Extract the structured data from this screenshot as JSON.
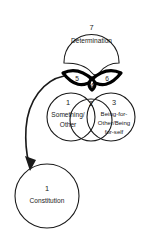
{
  "diagram": {
    "type": "logic-moment-diagram",
    "background_color": "#ffffff",
    "stroke_color": "#1a1a1a",
    "accent_color": "#000000",
    "top_node": {
      "number": "7",
      "label": "Determination"
    },
    "lens_left": {
      "number": "5"
    },
    "lens_center": {
      "number": "4"
    },
    "lens_right": {
      "number": "6"
    },
    "circle_left": {
      "number": "1",
      "line1": "Something/",
      "line2": "Other"
    },
    "circle_middle": {
      "number": "2"
    },
    "circle_right": {
      "number": "3",
      "line1": "Being-for-",
      "line2": "Other/Being",
      "line3": "for-self"
    },
    "bottom_node": {
      "number": "1",
      "label": "Constitution"
    },
    "arrow": {
      "name": "curved-arrow-to-constitution"
    }
  }
}
